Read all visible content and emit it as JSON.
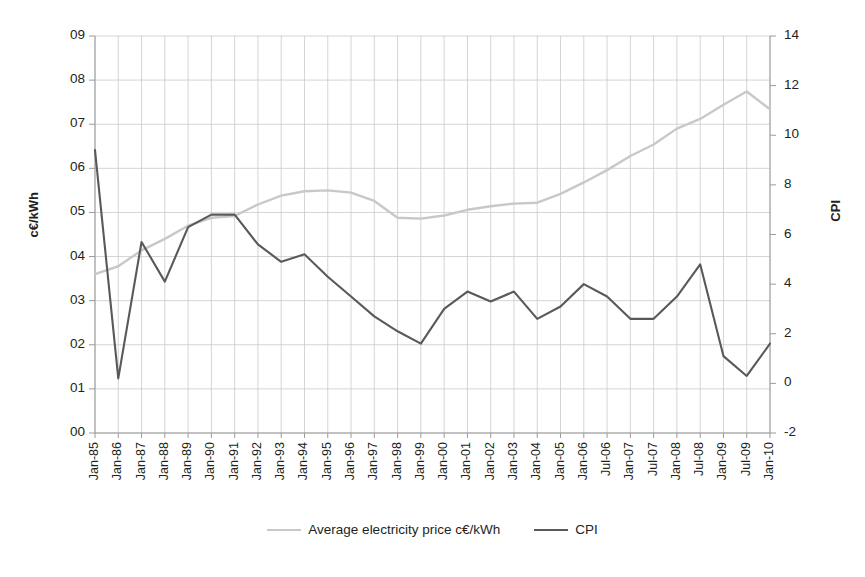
{
  "chart_data": {
    "type": "line",
    "title": "",
    "xlabel": "",
    "ylabel": "c€/kWh",
    "y2label": "CPI",
    "grid": true,
    "legend_position": "bottom",
    "ylim": [
      0,
      9
    ],
    "y2lim": [
      -2,
      14
    ],
    "yticks": [
      "00",
      "01",
      "02",
      "03",
      "04",
      "05",
      "06",
      "07",
      "08",
      "09"
    ],
    "ytick_values": [
      0,
      1,
      2,
      3,
      4,
      5,
      6,
      7,
      8,
      9
    ],
    "y2ticks": [
      "-2",
      "0",
      "2",
      "4",
      "6",
      "8",
      "10",
      "12",
      "14"
    ],
    "y2tick_values": [
      -2,
      0,
      2,
      4,
      6,
      8,
      10,
      12,
      14
    ],
    "categories": [
      "Jan-85",
      "Jan-86",
      "Jan-87",
      "Jan-88",
      "Jan-89",
      "Jan-90",
      "Jan-91",
      "Jan-92",
      "Jan-93",
      "Jan-94",
      "Jan-95",
      "Jan-96",
      "Jan-97",
      "Jan-98",
      "Jan-99",
      "Jan-00",
      "Jan-01",
      "Jan-02",
      "Jan-03",
      "Jan-04",
      "Jan-05",
      "Jan-06",
      "Jul-06",
      "Jan-07",
      "Jul-07",
      "Jan-08",
      "Jul-08",
      "Jan-09",
      "Jul-09",
      "Jan-10"
    ],
    "series": [
      {
        "name": "Average electricity price c€/kWh",
        "axis": "left",
        "color": "#c8c8c8",
        "values": [
          3.6,
          3.78,
          4.14,
          4.4,
          4.7,
          4.88,
          4.92,
          5.18,
          5.38,
          5.48,
          5.5,
          5.45,
          5.26,
          4.88,
          4.86,
          4.93,
          5.06,
          5.14,
          5.2,
          5.22,
          5.42,
          5.68,
          5.96,
          6.28,
          6.54,
          6.9,
          7.12,
          7.44,
          7.74,
          7.34
        ]
      },
      {
        "name": "CPI",
        "axis": "right",
        "color": "#595959",
        "values": [
          9.4,
          0.2,
          5.7,
          4.1,
          6.3,
          6.8,
          6.8,
          5.6,
          4.9,
          5.2,
          4.3,
          3.5,
          2.7,
          2.1,
          1.6,
          3.0,
          3.7,
          3.3,
          3.7,
          2.6,
          3.1,
          4.0,
          3.5,
          2.6,
          2.6,
          3.5,
          4.8,
          1.1,
          0.3,
          1.6
        ]
      }
    ]
  },
  "legend": {
    "entries": [
      {
        "label": "Average electricity price c€/kWh",
        "color": "#c8c8c8"
      },
      {
        "label": "CPI",
        "color": "#595959"
      }
    ]
  },
  "axes": {
    "left_title": "c€/kWh",
    "right_title": "CPI"
  }
}
